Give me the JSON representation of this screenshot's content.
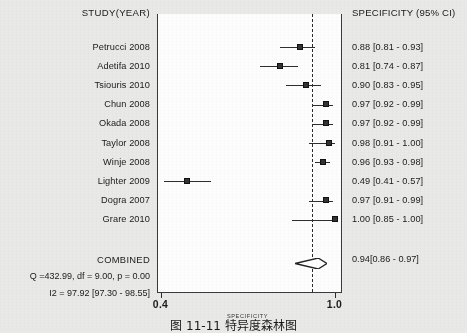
{
  "figure": {
    "header_left": "STUDY(YEAR)",
    "header_right": "SPECIFICITY (95% CI)",
    "combined_label": "COMBINED",
    "combined_ci_text": "0.94[0.86 - 0.97]",
    "stat_q": "Q =432.99, df = 9.00, p =  0.00",
    "stat_i2": "I2 = 97.92 [97.30 - 98.55]",
    "axis_title": "SPECIFICITY",
    "tick_low": "0.4",
    "tick_high": "1.0",
    "caption": "图 11-11  特异度森林图",
    "marker_color": "#333333",
    "line_color": "#2e2e2e",
    "frame_color": "#3a3a3a",
    "plot_bg": "#fdfdfd",
    "page_bg": "#e9e9e7"
  },
  "chart_data": {
    "type": "forest",
    "title": "",
    "xlabel": "SPECIFICITY",
    "ylabel": "",
    "xlim": [
      0.4,
      1.0
    ],
    "grid": false,
    "reference_line": 0.92,
    "measure": "SPECIFICITY (95% CI)",
    "heterogeneity": {
      "Q": 432.99,
      "df": 9.0,
      "p": 0.0,
      "I2": 97.92,
      "I2_ci": [
        97.3,
        98.55
      ]
    },
    "studies": [
      {
        "label": "Petrucci 2008",
        "estimate": 0.88,
        "ci_low": 0.81,
        "ci_high": 0.93,
        "text": "0.88 [0.81 - 0.93]"
      },
      {
        "label": "Adetifa 2010",
        "estimate": 0.81,
        "ci_low": 0.74,
        "ci_high": 0.87,
        "text": "0.81 [0.74 - 0.87]"
      },
      {
        "label": "Tsiouris 2010",
        "estimate": 0.9,
        "ci_low": 0.83,
        "ci_high": 0.95,
        "text": "0.90 [0.83 - 0.95]"
      },
      {
        "label": "Chun 2008",
        "estimate": 0.97,
        "ci_low": 0.92,
        "ci_high": 0.99,
        "text": "0.97 [0.92 - 0.99]"
      },
      {
        "label": "Okada 2008",
        "estimate": 0.97,
        "ci_low": 0.92,
        "ci_high": 0.99,
        "text": "0.97 [0.92 - 0.99]"
      },
      {
        "label": "Taylor 2008",
        "estimate": 0.98,
        "ci_low": 0.91,
        "ci_high": 1.0,
        "text": "0.98 [0.91 - 1.00]"
      },
      {
        "label": "Winje 2008",
        "estimate": 0.96,
        "ci_low": 0.93,
        "ci_high": 0.98,
        "text": "0.96 [0.93 - 0.98]"
      },
      {
        "label": "Lighter 2009",
        "estimate": 0.49,
        "ci_low": 0.41,
        "ci_high": 0.57,
        "text": "0.49 [0.41 - 0.57]"
      },
      {
        "label": "Dogra 2007",
        "estimate": 0.97,
        "ci_low": 0.91,
        "ci_high": 0.99,
        "text": "0.97 [0.91 - 0.99]"
      },
      {
        "label": "Grare 2010",
        "estimate": 1.0,
        "ci_low": 0.85,
        "ci_high": 1.0,
        "text": "1.00 [0.85 - 1.00]"
      }
    ],
    "combined": {
      "label": "COMBINED",
      "estimate": 0.94,
      "ci_low": 0.86,
      "ci_high": 0.97,
      "text": "0.94[0.86 - 0.97]"
    }
  }
}
